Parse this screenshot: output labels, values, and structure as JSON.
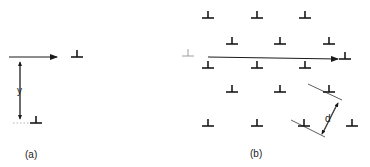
{
  "panels": [
    {
      "id": "a",
      "caption": "(a)",
      "dimension_label": "y",
      "dislocations": [
        {
          "x": 77,
          "y": 57
        },
        {
          "x": 36,
          "y": 123
        }
      ],
      "arrow": {
        "x1": 9,
        "y1": 57,
        "x2": 57,
        "y2": 57
      },
      "spacing_arrow": {
        "x": 20,
        "y1": 59,
        "y2": 122
      }
    },
    {
      "id": "b",
      "caption": "(b)",
      "dimension_label": "d",
      "dislocations": [
        {
          "x": 208,
          "y": 18
        },
        {
          "x": 257,
          "y": 18
        },
        {
          "x": 305,
          "y": 18
        },
        {
          "x": 232,
          "y": 44
        },
        {
          "x": 280,
          "y": 44
        },
        {
          "x": 329,
          "y": 44
        },
        {
          "x": 345,
          "y": 59
        },
        {
          "x": 208,
          "y": 68
        },
        {
          "x": 257,
          "y": 68
        },
        {
          "x": 305,
          "y": 68
        },
        {
          "x": 232,
          "y": 92
        },
        {
          "x": 280,
          "y": 92
        },
        {
          "x": 329,
          "y": 92
        },
        {
          "x": 208,
          "y": 126
        },
        {
          "x": 257,
          "y": 126
        },
        {
          "x": 304,
          "y": 126
        },
        {
          "x": 352,
          "y": 126
        }
      ],
      "ghost_dislocation": {
        "x": 188,
        "y": 56
      },
      "arrow": {
        "x1": 208,
        "y1": 57,
        "x2": 338,
        "y2": 59
      }
    }
  ],
  "colors": {
    "ink": "#1a1a1a",
    "ghost": "#888888"
  }
}
